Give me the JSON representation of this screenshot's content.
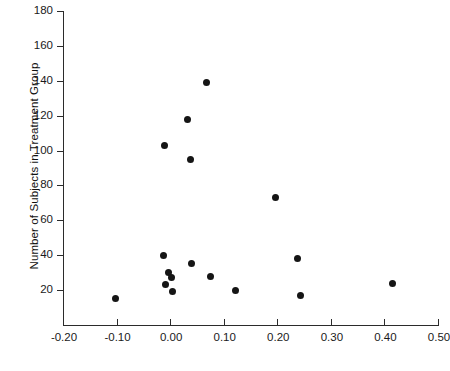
{
  "chart_data": {
    "type": "scatter",
    "title": "",
    "xlabel": "",
    "ylabel": "Number of Subjects in Treatment Group",
    "xlim": [
      -0.2,
      0.5
    ],
    "ylim": [
      0,
      180
    ],
    "xticks": [
      -0.2,
      -0.1,
      0.0,
      0.1,
      0.2,
      0.3,
      0.4,
      0.5
    ],
    "xtick_labels": [
      "-0.20",
      "-0.10",
      "0.00",
      "0.10",
      "0.20",
      "0.30",
      "0.40",
      "0.50"
    ],
    "yticks": [
      20,
      40,
      60,
      80,
      100,
      120,
      140,
      160,
      180
    ],
    "ytick_labels": [
      "20",
      "40",
      "60",
      "80",
      "100",
      "120",
      "140",
      "160",
      "180"
    ],
    "grid": false,
    "legend": null,
    "marker": "filled-circle",
    "marker_color": "#151515",
    "points": [
      {
        "x": -0.102,
        "y": 15
      },
      {
        "x": -0.013,
        "y": 40
      },
      {
        "x": -0.01,
        "y": 103
      },
      {
        "x": -0.008,
        "y": 23
      },
      {
        "x": -0.003,
        "y": 30
      },
      {
        "x": 0.002,
        "y": 27
      },
      {
        "x": 0.005,
        "y": 19
      },
      {
        "x": 0.032,
        "y": 118
      },
      {
        "x": 0.038,
        "y": 95
      },
      {
        "x": 0.04,
        "y": 35
      },
      {
        "x": 0.067,
        "y": 139
      },
      {
        "x": 0.075,
        "y": 28
      },
      {
        "x": 0.122,
        "y": 20
      },
      {
        "x": 0.197,
        "y": 73
      },
      {
        "x": 0.238,
        "y": 38
      },
      {
        "x": 0.243,
        "y": 17
      },
      {
        "x": 0.415,
        "y": 24
      }
    ]
  },
  "axes": {
    "y_axis_title": "Number of Subjects in Treatment Group"
  }
}
